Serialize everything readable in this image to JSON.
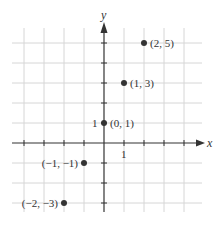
{
  "chart_data": {
    "type": "scatter",
    "title": "",
    "xlabel": "x",
    "ylabel": "y",
    "xlim": [
      -4.5,
      5
    ],
    "ylim": [
      -4.5,
      5.5
    ],
    "grid": true,
    "legend": null,
    "tick_labels": {
      "x": [
        "1"
      ],
      "y": [
        "1"
      ]
    },
    "points": [
      {
        "x": 2,
        "y": 5,
        "label": "(2, 5)"
      },
      {
        "x": 1,
        "y": 3,
        "label": "(1, 3)"
      },
      {
        "x": 0,
        "y": 1,
        "label": "(0, 1)"
      },
      {
        "x": -1,
        "y": -1,
        "label": "(−1, −1)"
      },
      {
        "x": -2,
        "y": -3,
        "label": "(−2, −3)"
      }
    ]
  },
  "colors": {
    "grid": "#d6d6d6",
    "axis": "#333333",
    "point": "#333333"
  }
}
